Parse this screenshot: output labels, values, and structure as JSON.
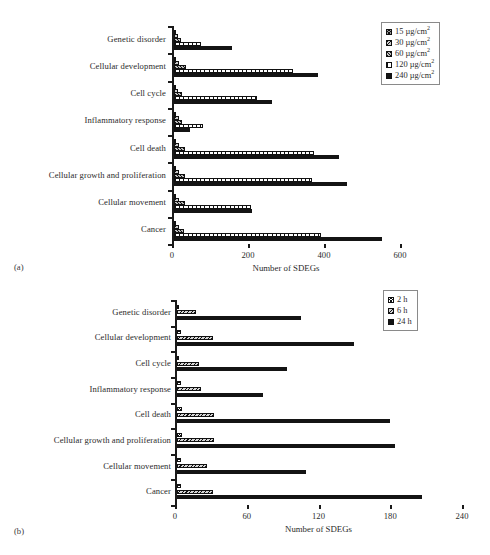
{
  "figure": {
    "panels": [
      {
        "tag": "(a)",
        "xlabel": "Number of SDEGs"
      },
      {
        "tag": "(b)",
        "xlabel": "Number of SDEGs"
      }
    ]
  },
  "chart_data": [
    {
      "type": "bar",
      "orientation": "horizontal",
      "panel": "(a)",
      "title": "",
      "xlabel": "Number of SDEGs",
      "ylabel": "",
      "xlim": [
        0,
        600
      ],
      "xticks": [
        0,
        200,
        400,
        600
      ],
      "grid": false,
      "legend_position": "top-right",
      "categories": [
        "Genetic disorder",
        "Cellular development",
        "Cell cycle",
        "Inflammatory response",
        "Cell death",
        "Cellular growth and proliferation",
        "Cellular movement",
        "Cancer"
      ],
      "series": [
        {
          "name": "15 µg/cm2",
          "label": "15 µg/cm",
          "exponent": "2",
          "values": [
            3,
            5,
            4,
            3,
            5,
            4,
            4,
            5
          ]
        },
        {
          "name": "30 µg/cm2",
          "label": "30 µg/cm",
          "exponent": "2",
          "values": [
            10,
            14,
            11,
            12,
            14,
            13,
            12,
            14
          ]
        },
        {
          "name": "60 µg/cm2",
          "label": "60 µg/cm",
          "exponent": "2",
          "values": [
            18,
            32,
            20,
            22,
            30,
            30,
            30,
            26
          ]
        },
        {
          "name": "120 µg/cm2",
          "label": "120 µg/cm",
          "exponent": "2",
          "values": [
            70,
            312,
            218,
            76,
            368,
            362,
            202,
            388
          ]
        },
        {
          "name": "240 µg/cm2",
          "label": "240 µg/cm",
          "exponent": "2",
          "values": [
            152,
            378,
            258,
            42,
            434,
            454,
            204,
            548
          ]
        }
      ]
    },
    {
      "type": "bar",
      "orientation": "horizontal",
      "panel": "(b)",
      "title": "",
      "xlabel": "Number of SDEGs",
      "ylabel": "",
      "xlim": [
        0,
        240
      ],
      "xticks": [
        0,
        60,
        120,
        180,
        240
      ],
      "grid": false,
      "legend_position": "top-right",
      "categories": [
        "Genetic disorder",
        "Cellular development",
        "Cell cycle",
        "Inflammatory response",
        "Cell death",
        "Cellular growth and proliferation",
        "Cellular movement",
        "Cancer"
      ],
      "series": [
        {
          "name": "2 h",
          "label": "2 h",
          "values": [
            2,
            3,
            2,
            3,
            4,
            4,
            3,
            3
          ]
        },
        {
          "name": "6 h",
          "label": "6 h",
          "values": [
            16,
            30,
            18,
            20,
            31,
            31,
            25,
            30
          ]
        },
        {
          "name": "24 h",
          "label": "24 h",
          "values": [
            104,
            148,
            92,
            72,
            178,
            182,
            108,
            205
          ]
        }
      ]
    }
  ]
}
